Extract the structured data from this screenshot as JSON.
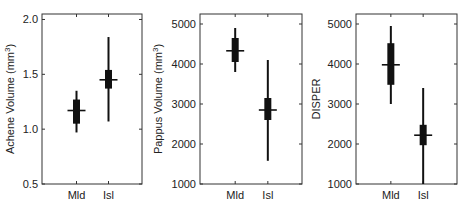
{
  "chart_data": [
    {
      "type": "box",
      "title": "",
      "xlabel": "",
      "ylabel": "Achene Volume (mm³)",
      "ylabel_parts": {
        "base": "Achene Volume (mm",
        "sup": "3",
        "end": ")"
      },
      "ylim": [
        0.5,
        2.0
      ],
      "yticks": [
        0.5,
        1.0,
        1.5,
        2.0
      ],
      "ytick_labels": [
        "0.5",
        "1.0",
        "1.5",
        "2.0"
      ],
      "categories": [
        "Mld",
        "Isl"
      ],
      "series": [
        {
          "name": "Mld",
          "whisker_low": 0.97,
          "q1": 1.05,
          "median": 1.17,
          "q3": 1.27,
          "whisker_high": 1.35
        },
        {
          "name": "Isl",
          "whisker_low": 1.07,
          "q1": 1.37,
          "median": 1.45,
          "q3": 1.54,
          "whisker_high": 1.84
        }
      ],
      "grid": false,
      "legend": null
    },
    {
      "type": "box",
      "title": "",
      "xlabel": "",
      "ylabel": "Pappus Volume (mm³)",
      "ylabel_parts": {
        "base": "Pappus Volume (mm",
        "sup": "3",
        "end": ")"
      },
      "ylim": [
        1000,
        5250
      ],
      "yticks": [
        1000,
        2000,
        3000,
        4000,
        5000
      ],
      "ytick_labels": [
        "1000",
        "2000",
        "3000",
        "4000",
        "5000"
      ],
      "categories": [
        "Mld",
        "Isl"
      ],
      "series": [
        {
          "name": "Mld",
          "whisker_low": 3800,
          "q1": 4050,
          "median": 4330,
          "q3": 4650,
          "whisker_high": 4900
        },
        {
          "name": "Isl",
          "whisker_low": 1580,
          "q1": 2600,
          "median": 2850,
          "q3": 3150,
          "whisker_high": 4100
        }
      ],
      "grid": false,
      "legend": null
    },
    {
      "type": "box",
      "title": "",
      "xlabel": "",
      "ylabel": "DISPER",
      "ylabel_parts": {
        "base": "DISPER",
        "sup": "",
        "end": ""
      },
      "ylim": [
        1000,
        5250
      ],
      "yticks": [
        1000,
        2000,
        3000,
        4000,
        5000
      ],
      "ytick_labels": [
        "1000",
        "2000",
        "3000",
        "4000",
        "5000"
      ],
      "categories": [
        "Mld",
        "Isl"
      ],
      "series": [
        {
          "name": "Mld",
          "whisker_low": 3000,
          "q1": 3480,
          "median": 3980,
          "q3": 4520,
          "whisker_high": 4950
        },
        {
          "name": "Isl",
          "whisker_low": 1000,
          "q1": 1970,
          "median": 2220,
          "q3": 2480,
          "whisker_high": 3400
        }
      ],
      "grid": false,
      "legend": null
    }
  ]
}
